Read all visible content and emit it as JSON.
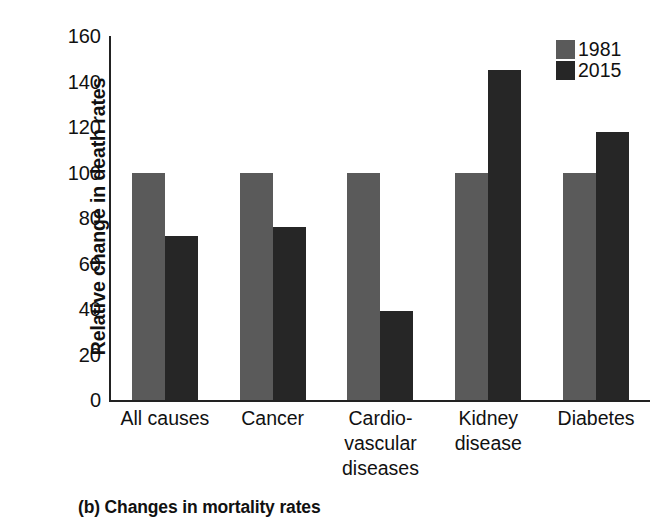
{
  "chart_data": {
    "type": "bar",
    "title": "",
    "caption": "(b) Changes in mortality rates",
    "xlabel": "",
    "ylabel": "Relative change in death rates",
    "ylim": [
      0,
      160
    ],
    "yticks": [
      0,
      20,
      40,
      60,
      80,
      100,
      120,
      140,
      160
    ],
    "ytick_labels": [
      "0",
      "20",
      "40",
      "60",
      "80",
      "100",
      "120",
      "140",
      "160"
    ],
    "grid": false,
    "legend_position": "top-right",
    "categories": [
      "All causes",
      "Cancer",
      "Cardio-\nvascular\ndiseases",
      "Kidney\ndisease",
      "Diabetes"
    ],
    "series": [
      {
        "name": "1981",
        "color": "#5a5a5a",
        "values": [
          100,
          100,
          100,
          100,
          100
        ]
      },
      {
        "name": "2015",
        "color": "#262626",
        "values": [
          72,
          76,
          39,
          145,
          118
        ]
      }
    ]
  },
  "colors": {
    "series_1981": "#5a5a5a",
    "series_2015": "#262626",
    "axis": "#222222",
    "background": "#ffffff",
    "text": "#111111"
  }
}
